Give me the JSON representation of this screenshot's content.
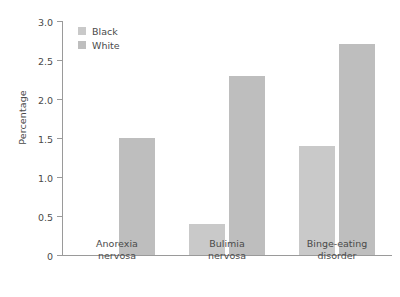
{
  "chart_data": {
    "type": "bar",
    "title": "",
    "xlabel": "",
    "ylabel": "Percentage",
    "ylim": [
      0,
      3.0
    ],
    "ytick_labels": [
      "3.0",
      "2.5",
      "2.0",
      "1.5",
      "1.0",
      "0.5",
      "0"
    ],
    "ytick_values": [
      3.0,
      2.5,
      2.0,
      1.5,
      1.0,
      0.5,
      0
    ],
    "grid": false,
    "legend_position": "top-left",
    "categories": [
      "Anorexia\nnervosa",
      "Bulimia\nnervosa",
      "Binge-eating\ndisorder"
    ],
    "series": [
      {
        "name": "Black",
        "color": "#c9c9c9",
        "values": [
          0,
          0.4,
          1.4
        ]
      },
      {
        "name": "White",
        "color": "#bebebe",
        "values": [
          1.5,
          2.3,
          2.7
        ]
      }
    ]
  }
}
